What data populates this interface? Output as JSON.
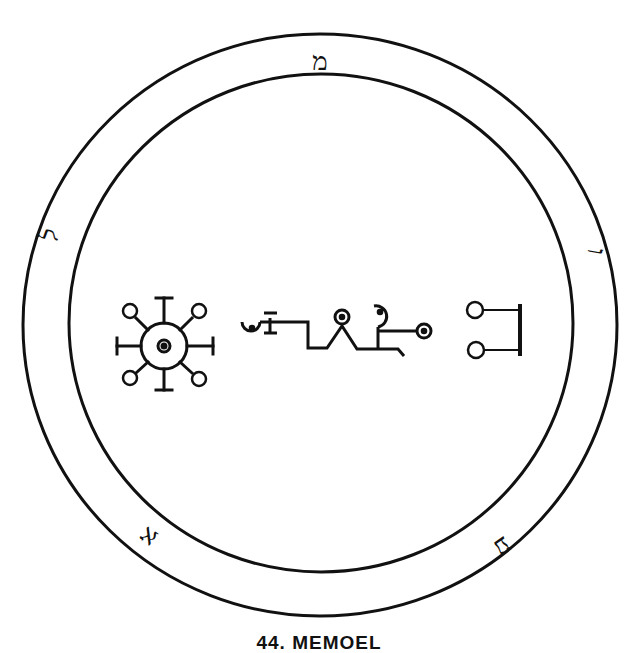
{
  "figure": {
    "type": "seal",
    "caption": "44. MEMOEL",
    "colors": {
      "ink": "#111111",
      "background": "#ffffff"
    }
  },
  "ring": {
    "outer_circle": {
      "cx": 320,
      "cy": 325,
      "rx": 297,
      "ry": 291
    },
    "inner_circle": {
      "cx": 321,
      "cy": 323,
      "rx": 252,
      "ry": 249
    },
    "letters": [
      {
        "glyph": "מ",
        "position": "top",
        "x": 320,
        "y": 63,
        "rotate": 0
      },
      {
        "glyph": "ו",
        "position": "right",
        "x": 588,
        "y": 250,
        "rotate": 100
      },
      {
        "glyph": "ע",
        "position": "bottom-right",
        "x": 500,
        "y": 545,
        "rotate": 145
      },
      {
        "glyph": "א",
        "position": "bottom-left",
        "x": 155,
        "y": 538,
        "rotate": 215
      },
      {
        "glyph": "ל",
        "position": "left",
        "x": 55,
        "y": 242,
        "rotate": 290
      }
    ]
  },
  "center_symbols": [
    {
      "name": "radiant-circle-sigil",
      "description": "central circle with dot, four T-ended rays and four circle-ended diagonal rays"
    },
    {
      "name": "connected-glyph-chain",
      "description": "hook, T bar, stepped line, peak with circle, hooked head and circle terminal"
    },
    {
      "name": "bracket-with-two-circles",
      "description": "vertical bar with two horizontal arms ending in circles"
    }
  ]
}
